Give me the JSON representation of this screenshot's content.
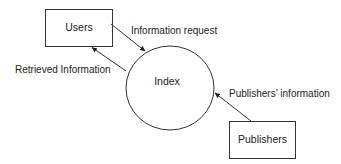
{
  "diagram": {
    "type": "data-flow",
    "colors": {
      "stroke": "#333333",
      "text": "#222222",
      "background": "#ffffff"
    },
    "nodes": {
      "users": {
        "label": "Users",
        "shape": "rectangle"
      },
      "index": {
        "label": "Index",
        "shape": "circle"
      },
      "publishers": {
        "label": "Publishers",
        "shape": "rectangle"
      }
    },
    "edges": {
      "information_request": {
        "label": "Information request",
        "from": "Users",
        "to": "Index"
      },
      "retrieved_information": {
        "label": "Retrieved Information",
        "from": "Index",
        "to": "Users"
      },
      "publishers_information": {
        "label": "Publishers’ information",
        "from": "Publishers",
        "to": "Index"
      }
    }
  }
}
